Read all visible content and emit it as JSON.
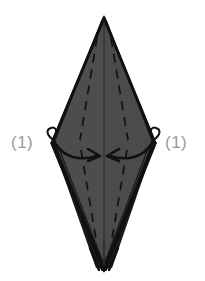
{
  "figure": {
    "kind": "origami-fold-diagram",
    "background_color": "#ffffff",
    "paper_fill_color": "#4d4d4d",
    "paper_edge_color": "#111111",
    "crease_color": "#111111",
    "arrow_color": "#111111",
    "label_color": "#9a9a9a"
  },
  "labels": {
    "left": "(1)",
    "right": "(1)"
  },
  "shape": {
    "name": "kite-base",
    "top_apex": {
      "x": 104,
      "y": 18
    },
    "left_vertex": {
      "x": 52,
      "y": 143
    },
    "right_vertex": {
      "x": 155,
      "y": 143
    },
    "bottom_apex": {
      "x": 104,
      "y": 270
    }
  },
  "annotations": {
    "left_arrow": "curved-arrow-pointing-right-inward",
    "right_arrow": "curved-arrow-pointing-left-inward",
    "left_hook": "small-loop-at-left-vertex",
    "right_hook": "small-loop-at-right-vertex",
    "center_line": "vertical-center-fold",
    "dashed_creases": "four-dashed-valley-fold-lines",
    "bottom_layers": "multiple-stacked-paper-points"
  }
}
